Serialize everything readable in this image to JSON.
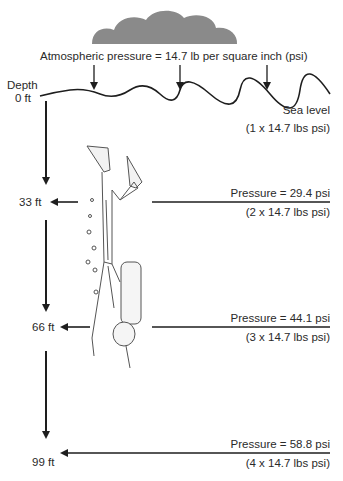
{
  "atmosphere": {
    "label": "Atmospheric pressure = 14.7 lb per square inch (psi)",
    "cloud_color": "#8a8a8a"
  },
  "depth_axis": {
    "title": "Depth",
    "levels": [
      {
        "depth": "0 ft",
        "pressure": "Sea level",
        "formula": "(1 x 14.7 lbs psi)"
      },
      {
        "depth": "33 ft",
        "pressure": "Pressure = 29.4 psi",
        "formula": "(2 x 14.7 lbs psi)"
      },
      {
        "depth": "66 ft",
        "pressure": "Pressure = 44.1 psi",
        "formula": "(3 x 14.7 lbs psi)"
      },
      {
        "depth": "99 ft",
        "pressure": "Pressure = 58.8 psi",
        "formula": "(4 x 14.7 lbs psi)"
      }
    ]
  },
  "colors": {
    "ink": "#1e1e1e",
    "text": "#2a2a2a",
    "cloud": "#8a8a8a"
  }
}
